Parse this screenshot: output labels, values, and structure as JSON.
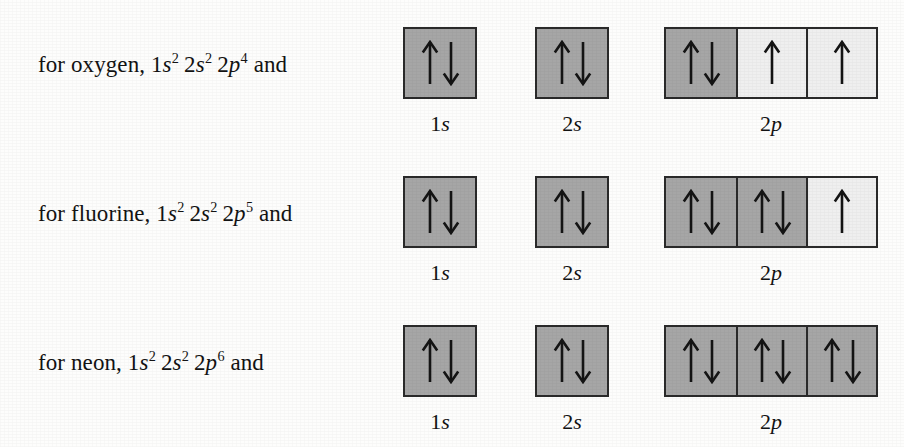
{
  "figure": {
    "background_color": "#fdfdfc",
    "filled_box_color": "#a6a6a6",
    "empty_box_color": "#efefef",
    "box_border_color": "#2a2a2a",
    "arrow_color": "#141414",
    "up_arrow_icon": "up-arrow",
    "down_arrow_icon": "down-arrow"
  },
  "rows": [
    {
      "caption_prefix": "for oxygen, ",
      "caption_suffix": " and",
      "element": "oxygen",
      "configuration": [
        {
          "shell": "1",
          "orbital": "s",
          "electrons": "2"
        },
        {
          "shell": "2",
          "orbital": "s",
          "electrons": "2"
        },
        {
          "shell": "2",
          "orbital": "p",
          "electrons": "4"
        }
      ],
      "groups": [
        {
          "label_shell": "1",
          "label_orbital": "s",
          "boxes": [
            {
              "fill": "filled",
              "spins": [
                "up",
                "down"
              ]
            }
          ]
        },
        {
          "label_shell": "2",
          "label_orbital": "s",
          "boxes": [
            {
              "fill": "filled",
              "spins": [
                "up",
                "down"
              ]
            }
          ]
        },
        {
          "label_shell": "2",
          "label_orbital": "p",
          "boxes": [
            {
              "fill": "filled",
              "spins": [
                "up",
                "down"
              ]
            },
            {
              "fill": "empty",
              "spins": [
                "up"
              ]
            },
            {
              "fill": "empty",
              "spins": [
                "up"
              ]
            }
          ]
        }
      ]
    },
    {
      "caption_prefix": "for fluorine, ",
      "caption_suffix": " and",
      "element": "fluorine",
      "configuration": [
        {
          "shell": "1",
          "orbital": "s",
          "electrons": "2"
        },
        {
          "shell": "2",
          "orbital": "s",
          "electrons": "2"
        },
        {
          "shell": "2",
          "orbital": "p",
          "electrons": "5"
        }
      ],
      "groups": [
        {
          "label_shell": "1",
          "label_orbital": "s",
          "boxes": [
            {
              "fill": "filled",
              "spins": [
                "up",
                "down"
              ]
            }
          ]
        },
        {
          "label_shell": "2",
          "label_orbital": "s",
          "boxes": [
            {
              "fill": "filled",
              "spins": [
                "up",
                "down"
              ]
            }
          ]
        },
        {
          "label_shell": "2",
          "label_orbital": "p",
          "boxes": [
            {
              "fill": "filled",
              "spins": [
                "up",
                "down"
              ]
            },
            {
              "fill": "filled",
              "spins": [
                "up",
                "down"
              ]
            },
            {
              "fill": "empty",
              "spins": [
                "up"
              ]
            }
          ]
        }
      ]
    },
    {
      "caption_prefix": "for neon, ",
      "caption_suffix": " and",
      "element": "neon",
      "configuration": [
        {
          "shell": "1",
          "orbital": "s",
          "electrons": "2"
        },
        {
          "shell": "2",
          "orbital": "s",
          "electrons": "2"
        },
        {
          "shell": "2",
          "orbital": "p",
          "electrons": "6"
        }
      ],
      "groups": [
        {
          "label_shell": "1",
          "label_orbital": "s",
          "boxes": [
            {
              "fill": "filled",
              "spins": [
                "up",
                "down"
              ]
            }
          ]
        },
        {
          "label_shell": "2",
          "label_orbital": "s",
          "boxes": [
            {
              "fill": "filled",
              "spins": [
                "up",
                "down"
              ]
            }
          ]
        },
        {
          "label_shell": "2",
          "label_orbital": "p",
          "boxes": [
            {
              "fill": "filled",
              "spins": [
                "up",
                "down"
              ]
            },
            {
              "fill": "filled",
              "spins": [
                "up",
                "down"
              ]
            },
            {
              "fill": "filled",
              "spins": [
                "up",
                "down"
              ]
            }
          ]
        }
      ]
    }
  ]
}
